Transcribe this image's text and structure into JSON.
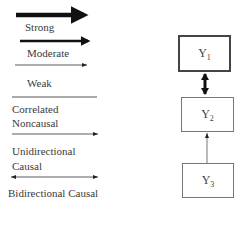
{
  "legend": {
    "items": [
      {
        "label": "Strong",
        "style": "thick-arrow"
      },
      {
        "label": "Moderate",
        "style": "medium-arrow"
      },
      {
        "label": "Weak",
        "style": "thin-arrow"
      },
      {
        "label_lines": [
          "Correlated",
          "Noncausal"
        ],
        "style": "plain-line"
      },
      {
        "label_lines": [
          "Unidirectional",
          "Causal"
        ],
        "style": "single-arrow"
      },
      {
        "label": "Bidirectional Causal",
        "style": "double-arrow"
      }
    ]
  },
  "diagram": {
    "nodes": [
      {
        "id": "Y1",
        "base": "Y",
        "sub": "1",
        "border": "strong"
      },
      {
        "id": "Y2",
        "base": "Y",
        "sub": "2",
        "border": "normal"
      },
      {
        "id": "Y3",
        "base": "Y",
        "sub": "3",
        "border": "normal"
      }
    ],
    "edges": [
      {
        "from": "Y1",
        "to": "Y2",
        "type": "bidirectional",
        "strength": "strong"
      },
      {
        "from": "Y3",
        "to": "Y2",
        "type": "unidirectional",
        "strength": "weak"
      }
    ]
  },
  "colors": {
    "line": "#1a1a1a",
    "box_border": "#555555",
    "text": "#3a3a3a"
  }
}
